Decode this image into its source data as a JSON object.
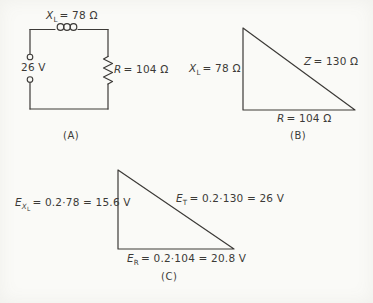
{
  "palette": {
    "paper": "#fafaf7",
    "ink": "#3c3a37"
  },
  "circuit": {
    "inductor_label": {
      "base": "X",
      "sub": "L",
      "rest": "= 78 Ω"
    },
    "source_label": "26 V",
    "resistor_label": {
      "base": "R",
      "rest": "= 104 Ω"
    },
    "caption": "(A)"
  },
  "impedance_triangle": {
    "vertical_label": {
      "base": "X",
      "sub": "L",
      "rest": "= 78 Ω"
    },
    "hypotenuse_label": {
      "base": "Z",
      "rest": "= 130 Ω"
    },
    "base_label": {
      "base": "R",
      "rest": "= 104 Ω"
    },
    "caption": "(B)"
  },
  "voltage_triangle": {
    "vertical_label": {
      "base": "E",
      "sub": "X",
      "subsub": "L",
      "rest": "= 0.2·78 = 15.6 V"
    },
    "hypotenuse_label": {
      "base": "E",
      "sub": "T",
      "rest": "= 0.2·130 = 26 V"
    },
    "base_label": {
      "base": "E",
      "sub": "R",
      "rest": "= 0.2·104 = 20.8 V"
    },
    "caption": "(C)"
  }
}
